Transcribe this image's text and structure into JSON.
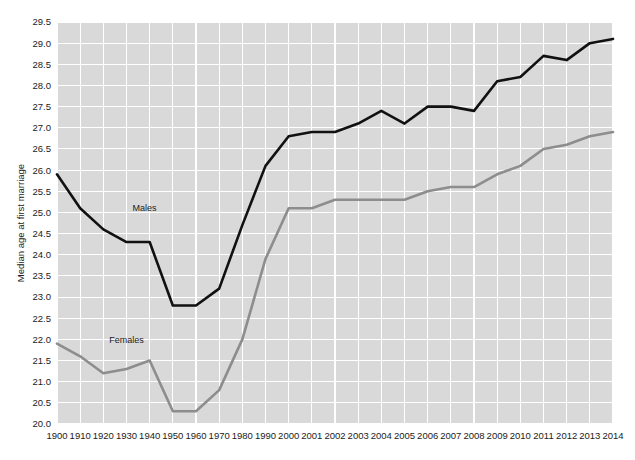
{
  "chart_data": {
    "type": "line",
    "title": "",
    "xlabel": "",
    "ylabel": "Median age at first marriage",
    "ylim": [
      20.0,
      29.5
    ],
    "ytick_labels": [
      "20.0",
      "20.5",
      "21.0",
      "21.5",
      "22.0",
      "22.5",
      "23.0",
      "23.5",
      "24.0",
      "24.5",
      "25.0",
      "25.5",
      "26.0",
      "26.5",
      "27.0",
      "27.5",
      "28.0",
      "28.5",
      "29.0",
      "29.5"
    ],
    "ytick_values": [
      20.0,
      20.5,
      21.0,
      21.5,
      22.0,
      22.5,
      23.0,
      23.5,
      24.0,
      24.5,
      25.0,
      25.5,
      26.0,
      26.5,
      27.0,
      27.5,
      28.0,
      28.5,
      29.0,
      29.5
    ],
    "categories": [
      "1900",
      "1910",
      "1920",
      "1930",
      "1940",
      "1950",
      "1960",
      "1970",
      "1980",
      "1990",
      "2000",
      "2001",
      "2002",
      "2003",
      "2004",
      "2005",
      "2006",
      "2007",
      "2008",
      "2009",
      "2010",
      "2011",
      "2012",
      "2013",
      "2014"
    ],
    "grid": true,
    "legend_position": "inline-annotation",
    "series": [
      {
        "name": "Males",
        "color": "#111111",
        "annotation": "Males",
        "values": [
          25.9,
          25.1,
          24.6,
          24.3,
          24.3,
          22.8,
          22.8,
          23.2,
          24.7,
          26.1,
          26.8,
          26.9,
          26.9,
          27.1,
          27.4,
          27.1,
          27.5,
          27.5,
          27.4,
          28.1,
          28.2,
          28.7,
          28.6,
          29.0,
          29.1
        ]
      },
      {
        "name": "Females",
        "color": "#8d8d8d",
        "annotation": "Females",
        "values": [
          21.9,
          21.6,
          21.2,
          21.3,
          21.5,
          20.3,
          20.3,
          20.8,
          22.0,
          23.9,
          25.1,
          25.1,
          25.3,
          25.3,
          25.3,
          25.3,
          25.5,
          25.6,
          25.6,
          25.9,
          26.1,
          26.5,
          26.6,
          26.8,
          26.9
        ]
      }
    ],
    "annotations": [
      {
        "label": "Males",
        "x_index": 3,
        "y_value": 24.95,
        "dx": 6,
        "dy": -4
      },
      {
        "label": "Females",
        "x_index": 2,
        "y_value": 21.82,
        "dx": 6,
        "dy": -4
      }
    ]
  },
  "layout": {
    "plot_left": 57,
    "plot_right": 613,
    "plot_top": 22,
    "plot_bottom": 424,
    "background": "#ffffff",
    "plot_background": "#d9d9d9",
    "grid_color": "#ffffff",
    "text_color": "#1b1b1b"
  }
}
